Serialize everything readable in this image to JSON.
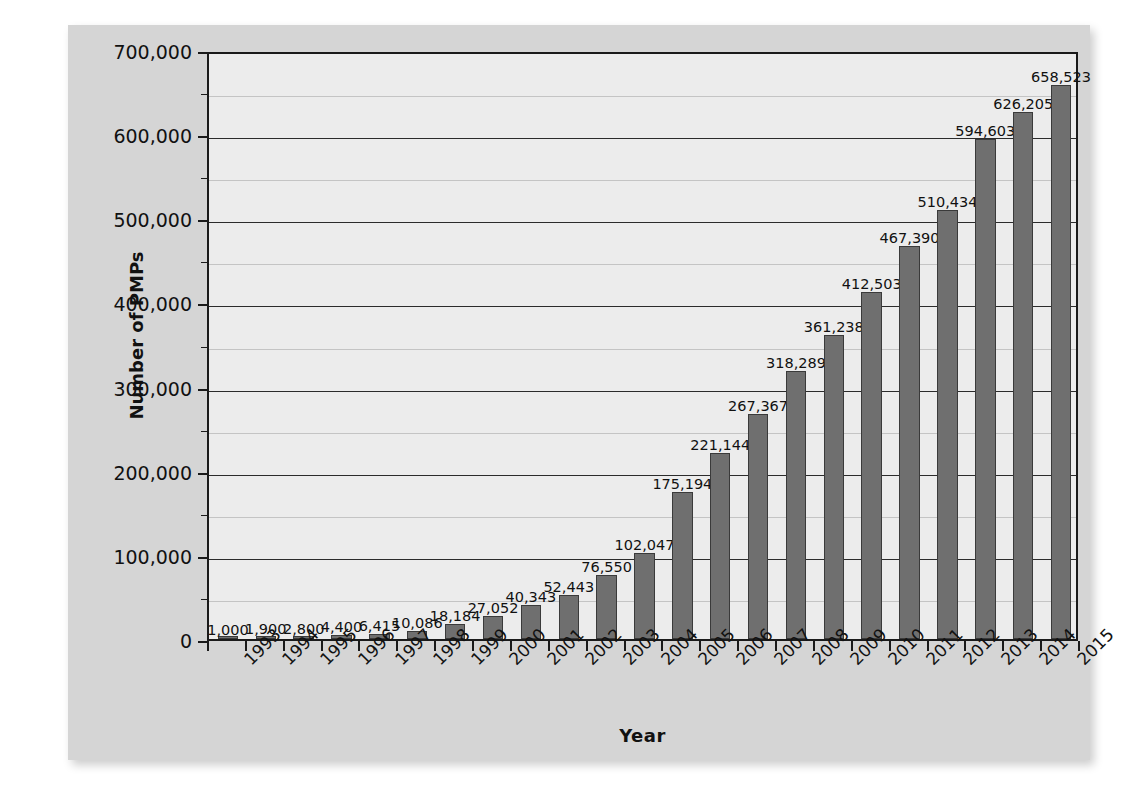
{
  "chart_data": {
    "type": "bar",
    "title": "",
    "xlabel": "Year",
    "ylabel": "Number of PMPs",
    "categories": [
      "1993",
      "1994",
      "1995",
      "1996",
      "1997",
      "1998",
      "1999",
      "2000",
      "2001",
      "2002",
      "2003",
      "2004",
      "2005",
      "2006",
      "2007",
      "2008",
      "2009",
      "2010",
      "2011",
      "2012",
      "2013",
      "2014",
      "2015"
    ],
    "values": [
      1000,
      1900,
      2800,
      4400,
      6415,
      10086,
      18184,
      27052,
      40343,
      52443,
      76550,
      102047,
      175194,
      221144,
      267367,
      318289,
      361238,
      412503,
      467390,
      510434,
      594603,
      626205,
      658523
    ],
    "value_labels": [
      "1,000",
      "1,900",
      "2,800",
      "4,400",
      "6,415",
      "10,086",
      "18,184",
      "27,052",
      "40,343",
      "52,443",
      "76,550",
      "102,047",
      "175,194",
      "221,144",
      "267,367",
      "318,289",
      "361,238",
      "412,503",
      "467,390",
      "510,434",
      "594,603",
      "626,205",
      "658,523"
    ],
    "ylim": [
      0,
      700000
    ],
    "ytick_values": [
      0,
      100000,
      200000,
      300000,
      400000,
      500000,
      600000,
      700000
    ],
    "ytick_labels": [
      "0",
      "100,000",
      "200,000",
      "300,000",
      "400,000",
      "500,000",
      "600,000",
      "700,000"
    ],
    "yminor_values": [
      50000,
      150000,
      250000,
      350000,
      450000,
      550000,
      650000
    ],
    "grid": true,
    "legend": "none",
    "series": [
      {
        "name": "Number of PMPs",
        "values": [
          1000,
          1900,
          2800,
          4400,
          6415,
          10086,
          18184,
          27052,
          40343,
          52443,
          76550,
          102047,
          175194,
          221144,
          267367,
          318289,
          361238,
          412503,
          467390,
          510434,
          594603,
          626205,
          658523
        ]
      }
    ]
  },
  "colors": {
    "bar_fill": "#6f6f6f",
    "bar_stroke": "#3a3a3a",
    "plot_background": "#ececec",
    "panel_background": "#d5d5d5",
    "axis": "#1a1a1a",
    "gridline": "#2b2b2b",
    "text": "#111111"
  }
}
